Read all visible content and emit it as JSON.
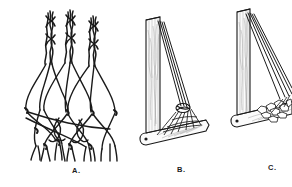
{
  "plate": {
    "background_color": "#ffffff",
    "ink_color": "#1a1a1a",
    "shade_color": "#8a8a8a",
    "description": "Line-drawing plate of three figures illustrating netted cordage and braced bracket constructions"
  },
  "captions": {
    "a": "A.",
    "b": "B.",
    "c": "C."
  },
  "figures": [
    {
      "id": "a",
      "label": "A.",
      "title": "Braided cords opening into a knotted net",
      "braid_count": 3,
      "net_rows": 4,
      "loose_end_count": 12
    },
    {
      "id": "b",
      "label": "B.",
      "title": "Bracket with converging cords gathered at a single point",
      "diagonal_cord_count": 4,
      "has_base_pivot_hole": true,
      "has_stone_pile": false
    },
    {
      "id": "c",
      "label": "C.",
      "title": "Bracket with diverging cords and stone pile at corner",
      "diagonal_cord_count": 4,
      "has_base_pivot_hole": true,
      "has_stone_pile": true
    }
  ]
}
